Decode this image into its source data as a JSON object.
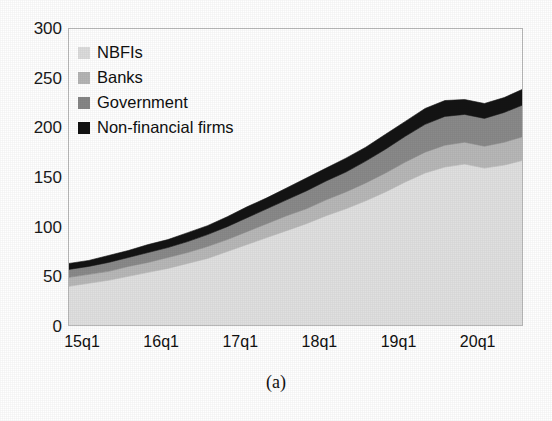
{
  "figure": {
    "caption": "(a)"
  },
  "chart_data": {
    "type": "area",
    "stacked": true,
    "title": "",
    "xlabel": "",
    "ylabel": "",
    "ylim": [
      0,
      300
    ],
    "yticks": [
      0,
      50,
      100,
      150,
      200,
      250,
      300
    ],
    "grid": false,
    "legend_position": "top-left",
    "x": [
      "15q1",
      "15q2",
      "15q3",
      "15q4",
      "16q1",
      "16q2",
      "16q3",
      "16q4",
      "17q1",
      "17q2",
      "17q3",
      "17q4",
      "18q1",
      "18q2",
      "18q3",
      "18q4",
      "19q1",
      "19q2",
      "19q3",
      "19q4",
      "20q1",
      "20q2",
      "20q3",
      "20q4"
    ],
    "xtick_labels": [
      "15q1",
      "16q1",
      "17q1",
      "18q1",
      "19q1",
      "20q1"
    ],
    "xtick_positions": [
      "15q1",
      "16q1",
      "17q1",
      "18q1",
      "19q1",
      "20q1"
    ],
    "series": [
      {
        "name": "NBFIs",
        "color": "#e0e0e0",
        "values": [
          41,
          44,
          47,
          51,
          55,
          59,
          64,
          69,
          76,
          83,
          90,
          97,
          104,
          112,
          119,
          127,
          136,
          146,
          155,
          161,
          164,
          160,
          163,
          168
        ]
      },
      {
        "name": "Banks",
        "color": "#b8b8b8",
        "values": [
          9,
          9,
          9,
          10,
          10,
          11,
          11,
          12,
          12,
          13,
          14,
          15,
          15,
          16,
          17,
          18,
          19,
          20,
          21,
          22,
          22,
          22,
          23,
          24
        ]
      },
      {
        "name": "Government",
        "color": "#8a8a8a",
        "values": [
          8,
          8,
          9,
          9,
          10,
          10,
          11,
          12,
          13,
          14,
          15,
          16,
          18,
          19,
          20,
          22,
          24,
          26,
          28,
          29,
          28,
          28,
          30,
          32
        ]
      },
      {
        "name": "Non-financial firms",
        "color": "#141414",
        "values": [
          6,
          6,
          7,
          7,
          8,
          8,
          9,
          9,
          10,
          11,
          11,
          12,
          13,
          13,
          14,
          14,
          15,
          15,
          16,
          16,
          15,
          15,
          15,
          16
        ]
      }
    ],
    "totals": [
      64,
      67,
      72,
      77,
      83,
      88,
      95,
      102,
      111,
      121,
      130,
      140,
      150,
      160,
      170,
      181,
      194,
      207,
      220,
      228,
      229,
      225,
      231,
      240
    ]
  },
  "legend": {
    "items": [
      {
        "label": "NBFIs",
        "color": "#dcdcdc"
      },
      {
        "label": "Banks",
        "color": "#b5b5b5"
      },
      {
        "label": "Government",
        "color": "#868686"
      },
      {
        "label": "Non-financial firms",
        "color": "#121212"
      }
    ]
  }
}
